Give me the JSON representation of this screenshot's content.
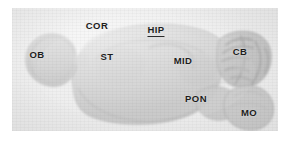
{
  "figure": {
    "kind": "sagittal-brain-section",
    "modality": "grayscale photomicrograph",
    "panel": {
      "left": 12,
      "top": 8,
      "width": 266,
      "height": 123,
      "background_color": "#ececec"
    },
    "colors": {
      "background": "#ffffff",
      "panel_background": "#ecececec",
      "tissue_light": "#d9d9d9",
      "tissue_mid": "#cacaca",
      "tissue_dark": "#b4b4b4",
      "outline": "#a8a8a8",
      "label_text": "#1d1d1d"
    }
  },
  "labels": [
    {
      "id": "ob",
      "text": "OB",
      "full_name": "olfactory bulb",
      "x": 37,
      "y": 55,
      "underlined": false
    },
    {
      "id": "cor",
      "text": "COR",
      "full_name": "cortex",
      "x": 97,
      "y": 26,
      "underlined": false
    },
    {
      "id": "st",
      "text": "ST",
      "full_name": "striatum",
      "x": 107,
      "y": 57,
      "underlined": false
    },
    {
      "id": "hip",
      "text": "HIP",
      "full_name": "hippocampus",
      "x": 156,
      "y": 31,
      "underlined": true
    },
    {
      "id": "mid",
      "text": "MID",
      "full_name": "midbrain",
      "x": 183,
      "y": 61,
      "underlined": false
    },
    {
      "id": "cb",
      "text": "CB",
      "full_name": "cerebellum",
      "x": 240,
      "y": 52,
      "underlined": false
    },
    {
      "id": "pon",
      "text": "PON",
      "full_name": "pons",
      "x": 196,
      "y": 99,
      "underlined": false
    },
    {
      "id": "mo",
      "text": "MO",
      "full_name": "medulla oblongata",
      "x": 249,
      "y": 113,
      "underlined": false
    }
  ]
}
